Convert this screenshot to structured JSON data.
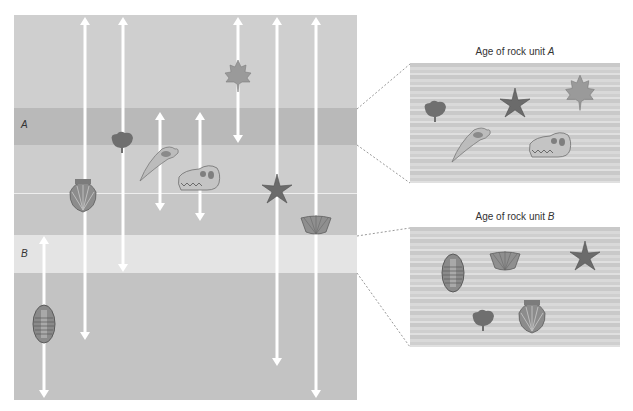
{
  "figure": {
    "rock_units": [
      {
        "id": "upper",
        "label": "",
        "y_top": 15,
        "y_bottom": 108,
        "fill": "#cfcfcf"
      },
      {
        "id": "A",
        "label": "A",
        "y_top": 108,
        "y_bottom": 145,
        "fill": "#b9b9b9"
      },
      {
        "id": "mid1",
        "label": "",
        "y_top": 145,
        "y_bottom": 193,
        "fill": "#cdcdcd"
      },
      {
        "id": "mid2",
        "label": "",
        "y_top": 194,
        "y_bottom": 235,
        "fill": "#c6c6c6"
      },
      {
        "id": "B",
        "label": "B",
        "y_top": 235,
        "y_bottom": 273,
        "fill": "#e4e4e4"
      },
      {
        "id": "lower",
        "label": "",
        "y_top": 273,
        "y_bottom": 400,
        "fill": "#c3c3c3"
      }
    ],
    "fossil_ranges": [
      {
        "fossil": "trilobite",
        "x": 44,
        "y_top": 236,
        "y_bottom": 398
      },
      {
        "fossil": "scallop-shell",
        "x": 85,
        "y_top": 17,
        "y_bottom": 340
      },
      {
        "fossil": "ginkgo-leaf",
        "x": 123,
        "y_top": 17,
        "y_bottom": 272
      },
      {
        "fossil": "bird-skull",
        "x": 160,
        "y_top": 112,
        "y_bottom": 211
      },
      {
        "fossil": "dinosaur-skull",
        "x": 200,
        "y_top": 112,
        "y_bottom": 221
      },
      {
        "fossil": "maple-leaf",
        "x": 238,
        "y_top": 17,
        "y_bottom": 143
      },
      {
        "fossil": "starfish",
        "x": 277,
        "y_top": 17,
        "y_bottom": 366
      },
      {
        "fossil": "brachiopod",
        "x": 316,
        "y_top": 17,
        "y_bottom": 398
      }
    ],
    "panels": [
      {
        "id": "panel-a",
        "title_prefix": "Age of rock unit ",
        "title_unit": "A",
        "fossils": [
          "ginkgo-leaf",
          "starfish",
          "maple-leaf",
          "bird-skull",
          "dinosaur-skull"
        ]
      },
      {
        "id": "panel-b",
        "title_prefix": "Age of rock unit ",
        "title_unit": "B",
        "fossils": [
          "trilobite",
          "brachiopod",
          "starfish",
          "ginkgo-leaf",
          "scallop-shell"
        ]
      }
    ]
  },
  "labels": {
    "unit_a": "A",
    "unit_b": "B"
  },
  "colors": {
    "arrow": "#ffffff",
    "fossil_dark": "#6e6e6e",
    "fossil_mid": "#8e8e8e",
    "fossil_light": "#b8b8b8",
    "connector": "#9a9a9a"
  }
}
